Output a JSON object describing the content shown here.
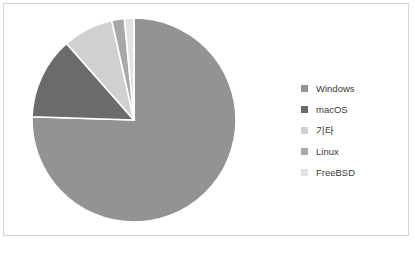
{
  "chart_data": {
    "type": "pie",
    "title": "",
    "categories": [
      "Windows",
      "macOS",
      "기타",
      "Linux",
      "FreeBSD"
    ],
    "values": [
      75.5,
      13.0,
      8.0,
      2.0,
      1.5
    ],
    "colors": [
      "#939393",
      "#6b6b6b",
      "#d0d0d0",
      "#a8a8a8",
      "#e2e2e2"
    ],
    "legend_position": "right",
    "grid": false,
    "start_angle": 0,
    "direction": "clockwise",
    "slice_border_color": "#ffffff"
  },
  "legend": {
    "items": [
      {
        "label": "Windows",
        "color": "#939393"
      },
      {
        "label": "macOS",
        "color": "#6b6b6b"
      },
      {
        "label": "기타",
        "color": "#d0d0d0"
      },
      {
        "label": "Linux",
        "color": "#a8a8a8"
      },
      {
        "label": "FreeBSD",
        "color": "#e2e2e2"
      }
    ]
  },
  "frame": {
    "border_color": "#d4d4d4",
    "background": "#ffffff"
  }
}
